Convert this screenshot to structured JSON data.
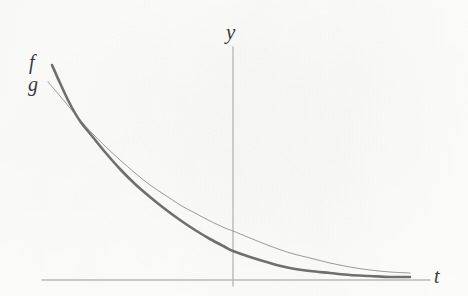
{
  "figure": {
    "background_color": "#fdfdfc",
    "axis_color": "#b9b9b9",
    "curve_color_f": "#6f6f6f",
    "curve_color_g": "#9a9a9a",
    "label_color": "#3a3a3a",
    "labels": {
      "y_axis": "y",
      "t_axis": "t",
      "curve_f": "f",
      "curve_g": "g"
    }
  },
  "chart_data": {
    "type": "line",
    "title": "",
    "xlabel": "t",
    "ylabel": "y",
    "grid": false,
    "legend": "inline-curve-labels",
    "axes": {
      "t_axis": {
        "y_px": 280,
        "x_start_px": 42,
        "x_end_px": 430
      },
      "y_axis": {
        "x_px": 233,
        "y_top_px": 47,
        "y_bottom_px": 286
      }
    },
    "annotations": [
      {
        "text": "f",
        "x_px": 34,
        "y_px": 62,
        "describes": "thick decaying curve, larger initial value, faster decay"
      },
      {
        "text": "g",
        "x_px": 33,
        "y_px": 84,
        "describes": "thin decaying curve, smaller initial value, slower decay"
      },
      {
        "text": "y",
        "x_px": 232,
        "y_px": 32,
        "describes": "vertical axis label"
      },
      {
        "text": "t",
        "x_px": 439,
        "y_px": 276,
        "describes": "horizontal axis label"
      }
    ],
    "crossing_point": {
      "x_px": 92,
      "y_px": 133,
      "note": "f and g intersect once; f above g before, below g after"
    },
    "series": [
      {
        "name": "f",
        "style": "thick",
        "linewidth_px": 2.6,
        "color": "#6f6f6f",
        "points_px": [
          [
            52,
            65
          ],
          [
            60,
            83
          ],
          [
            70,
            104
          ],
          [
            80,
            121
          ],
          [
            92,
            136
          ],
          [
            105,
            152
          ],
          [
            120,
            169
          ],
          [
            135,
            184
          ],
          [
            150,
            197
          ],
          [
            165,
            209
          ],
          [
            180,
            220
          ],
          [
            195,
            230
          ],
          [
            210,
            239
          ],
          [
            225,
            247
          ],
          [
            233,
            251
          ],
          [
            250,
            257
          ],
          [
            270,
            263
          ],
          [
            290,
            268
          ],
          [
            310,
            271
          ],
          [
            330,
            273
          ],
          [
            350,
            275
          ],
          [
            370,
            276
          ],
          [
            390,
            277
          ],
          [
            410,
            277
          ]
        ]
      },
      {
        "name": "g",
        "style": "thin",
        "linewidth_px": 1.0,
        "color": "#9a9a9a",
        "points_px": [
          [
            48,
            82
          ],
          [
            60,
            96
          ],
          [
            70,
            108
          ],
          [
            80,
            120
          ],
          [
            92,
            133
          ],
          [
            105,
            146
          ],
          [
            120,
            160
          ],
          [
            135,
            173
          ],
          [
            150,
            185
          ],
          [
            165,
            195
          ],
          [
            180,
            205
          ],
          [
            195,
            213
          ],
          [
            210,
            221
          ],
          [
            225,
            228
          ],
          [
            233,
            231
          ],
          [
            250,
            238
          ],
          [
            270,
            246
          ],
          [
            290,
            253
          ],
          [
            310,
            258
          ],
          [
            330,
            263
          ],
          [
            350,
            267
          ],
          [
            370,
            270
          ],
          [
            390,
            272
          ],
          [
            410,
            273
          ]
        ]
      }
    ]
  }
}
